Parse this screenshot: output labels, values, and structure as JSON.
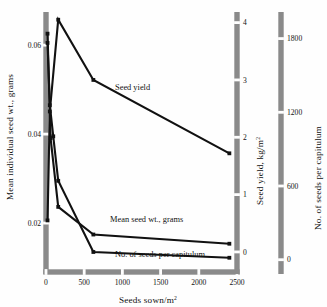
{
  "chart_data": {
    "type": "line",
    "title": "",
    "xlabel": "Seeds sown/m²",
    "xlim": [
      0,
      2500
    ],
    "xticks": [
      0,
      500,
      1000,
      1500,
      2000,
      2500
    ],
    "xticklabels": [
      "0",
      "500",
      "1000",
      "1500",
      "2000",
      "2500"
    ],
    "grid": false,
    "legend": "inline-annotations",
    "axes": [
      {
        "id": "left",
        "position": "left",
        "label": "Mean individual seed wt., grams",
        "lim": [
          0.009,
          0.067
        ],
        "ticks": [
          0.02,
          0.04,
          0.06
        ],
        "ticklabels": [
          "0.02",
          "0.04",
          "0.06"
        ]
      },
      {
        "id": "right-inner",
        "position": "right-inner",
        "label": "Seed yield, kg/m²",
        "unit": "kg/m²",
        "lim": [
          -0.35,
          4.15
        ],
        "ticks": [
          0,
          1,
          2,
          3,
          4
        ],
        "ticklabels": [
          "0",
          "1",
          "2",
          "3",
          "4"
        ]
      },
      {
        "id": "right-outer",
        "position": "right-outer",
        "label": "No. of seeds per capitulum",
        "lim": [
          -100,
          2000
        ],
        "ticks": [
          0,
          600,
          1200,
          1800
        ],
        "ticklabels": [
          "0",
          "600",
          "1200",
          "1800"
        ]
      }
    ],
    "series": [
      {
        "name": "Seed yield",
        "axis": "right-inner",
        "units": "kg/m²",
        "annotation": "Seed yield",
        "points": [
          {
            "x": 20,
            "y": 0.55
          },
          {
            "x": 50,
            "y": 2.45
          },
          {
            "x": 160,
            "y": 4.05
          },
          {
            "x": 620,
            "y": 3.0
          },
          {
            "x": 2400,
            "y": 1.72
          }
        ]
      },
      {
        "name": "Mean seed wt., grams",
        "axis": "left",
        "units": "grams",
        "annotation": "Mean seed wt., grams",
        "points": [
          {
            "x": 20,
            "y": 0.0605
          },
          {
            "x": 50,
            "y": 0.0465
          },
          {
            "x": 95,
            "y": 0.0395
          },
          {
            "x": 160,
            "y": 0.0295
          },
          {
            "x": 620,
            "y": 0.0135
          },
          {
            "x": 2400,
            "y": 0.0122
          }
        ]
      },
      {
        "name": "No. of seeds per capitulum",
        "axis": "right-outer",
        "units": "seeds",
        "annotation": "No. of seeds per capitulum",
        "points": [
          {
            "x": 20,
            "y": 1840
          },
          {
            "x": 60,
            "y": 990
          },
          {
            "x": 160,
            "y": 430
          },
          {
            "x": 620,
            "y": 205
          },
          {
            "x": 2400,
            "y": 130
          }
        ]
      }
    ],
    "annotations": [
      {
        "text": "Seed yield",
        "x_px": 115,
        "y_px": 90
      },
      {
        "text": "Mean seed wt., grams",
        "x_px": 110,
        "y_px": 222
      },
      {
        "text": "No. of seeds per capitulum",
        "x_px": 115,
        "y_px": 257
      }
    ],
    "style": {
      "axis_bar_color": "#8a8a8a",
      "line_color": "#111111",
      "marker": "square",
      "background": "#fefefe"
    }
  }
}
